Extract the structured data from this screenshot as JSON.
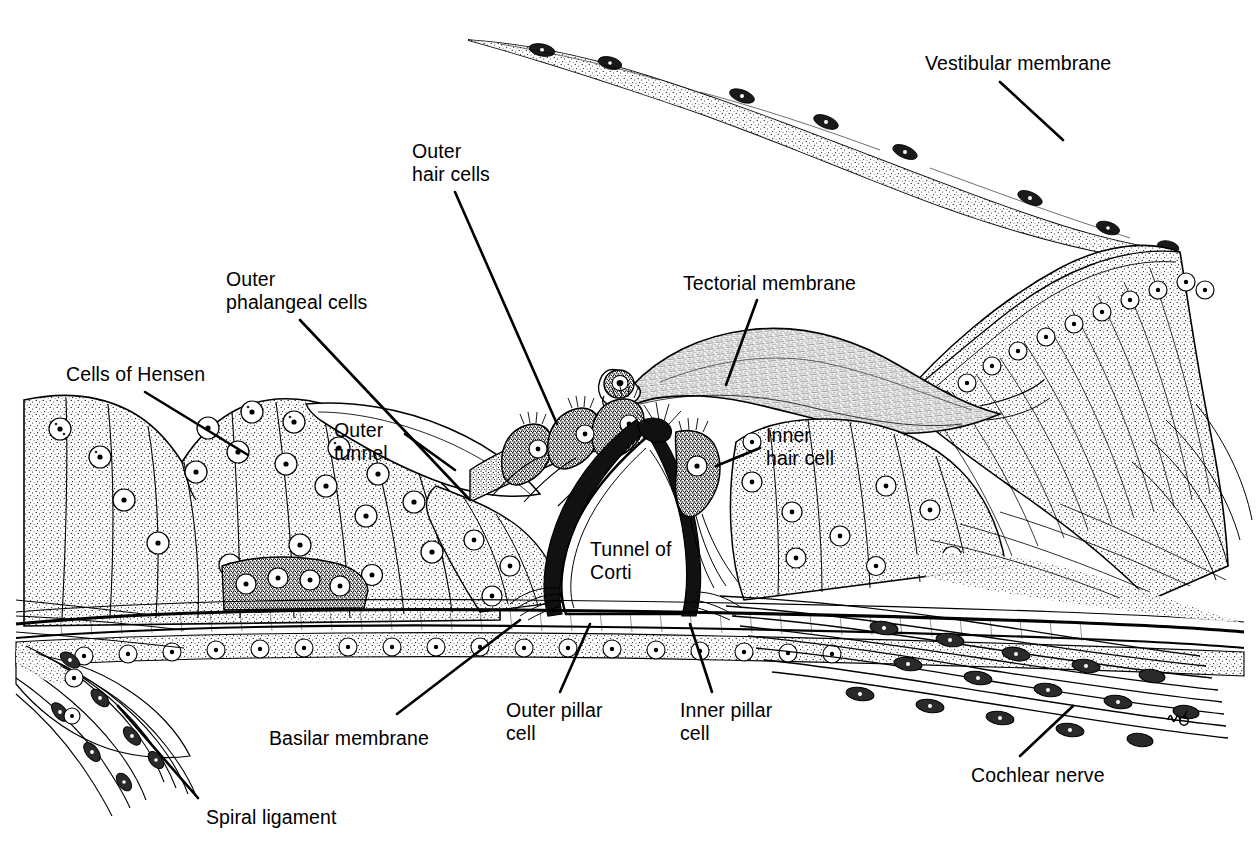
{
  "figure": {
    "style": "black-and-white stippled line drawing",
    "artist_signature": "uo"
  },
  "labels": [
    {
      "id": "vestibular-membrane",
      "text": "Vestibular membrane",
      "x": 925,
      "y": 52,
      "align": "left",
      "leader": [
        [
          1000,
          82
        ],
        [
          1063,
          140
        ]
      ]
    },
    {
      "id": "outer-hair-cells",
      "text": "Outer\nhair cells",
      "x": 412,
      "y": 140,
      "align": "left",
      "leader": [
        [
          455,
          192
        ],
        [
          557,
          424
        ]
      ]
    },
    {
      "id": "outer-phalangeal-cells",
      "text": "Outer\nphalangeal cells",
      "x": 226,
      "y": 268,
      "align": "left",
      "leader": [
        [
          300,
          320
        ],
        [
          470,
          500
        ]
      ]
    },
    {
      "id": "tectorial-membrane",
      "text": "Tectorial membrane",
      "x": 683,
      "y": 272,
      "align": "left",
      "leader": [
        [
          757,
          300
        ],
        [
          726,
          385
        ]
      ]
    },
    {
      "id": "cells-of-hensen",
      "text": "Cells of Hensen",
      "x": 66,
      "y": 363,
      "align": "left",
      "leader": [
        [
          145,
          392
        ],
        [
          248,
          455
        ]
      ]
    },
    {
      "id": "outer-tunnel",
      "text": "Outer\ntunnel",
      "x": 334,
      "y": 419,
      "align": "left",
      "leader": [
        [
          405,
          434
        ],
        [
          455,
          470
        ]
      ]
    },
    {
      "id": "inner-hair-cell",
      "text": "Inner\nhair cell",
      "x": 766,
      "y": 424,
      "align": "left",
      "leader": [
        [
          760,
          448
        ],
        [
          716,
          466
        ]
      ]
    },
    {
      "id": "tunnel-of-corti",
      "text": "Tunnel of\nCorti",
      "x": 590,
      "y": 538,
      "align": "left",
      "leader": null
    },
    {
      "id": "basilar-membrane",
      "text": "Basilar membrane",
      "x": 269,
      "y": 727,
      "align": "left",
      "leader": [
        [
          397,
          714
        ],
        [
          520,
          620
        ]
      ]
    },
    {
      "id": "outer-pillar-cell",
      "text": "Outer pillar\ncell",
      "x": 506,
      "y": 699,
      "align": "left",
      "leader": [
        [
          560,
          692
        ],
        [
          590,
          624
        ]
      ]
    },
    {
      "id": "inner-pillar-cell",
      "text": "Inner pillar\ncell",
      "x": 680,
      "y": 699,
      "align": "left",
      "leader": [
        [
          712,
          692
        ],
        [
          690,
          624
        ]
      ]
    },
    {
      "id": "cochlear-nerve",
      "text": "Cochlear nerve",
      "x": 971,
      "y": 764,
      "align": "left",
      "leader": [
        [
          1020,
          756
        ],
        [
          1073,
          706
        ]
      ]
    },
    {
      "id": "spiral-ligament",
      "text": "Spiral ligament",
      "x": 206,
      "y": 806,
      "align": "left",
      "leader": [
        [
          198,
          798
        ],
        [
          118,
          706
        ]
      ]
    }
  ],
  "structures": [
    {
      "id": "vestibular-membrane",
      "name": "Vestibular membrane (Reissner's membrane)",
      "description": "thin two-cell-thick undulating sheet running from upper-left to upper-right"
    },
    {
      "id": "tectorial-membrane",
      "name": "Tectorial membrane",
      "description": "wavy fibrous flap with spiral curled free end overlying the hair cells"
    },
    {
      "id": "spiral-limbus",
      "name": "Spiral limbus",
      "description": "large stippled wedge at right with radial striations and a row of nuclei"
    },
    {
      "id": "organ-of-corti",
      "name": "Organ of Corti",
      "description": "central cell complex containing hair cells, pillar cells and tunnel"
    },
    {
      "id": "tunnel-of-corti",
      "name": "Tunnel of Corti",
      "description": "clear triangular space between inner and outer pillar cells"
    },
    {
      "id": "outer-hair-cells",
      "name": "Outer hair cells",
      "description": "three darkly stippled tilted cells with apical stereocilia"
    },
    {
      "id": "inner-hair-cell",
      "name": "Inner hair cell",
      "description": "single flask-shaped cell medial to the inner pillar cell"
    },
    {
      "id": "cells-of-hensen",
      "name": "Cells of Hensen",
      "description": "tall columnar supporting cells at the left forming a sloping bank"
    },
    {
      "id": "outer-phalangeal-cells",
      "name": "Outer phalangeal cells (Deiters' cells)",
      "description": "supporting cells beneath and between the outer hair cells"
    },
    {
      "id": "outer-tunnel",
      "name": "Outer tunnel",
      "description": "clear space lateral to the outer hair cells"
    },
    {
      "id": "basilar-membrane",
      "name": "Basilar membrane",
      "description": "horizontal fibrous band running the full width beneath the organ of Corti"
    },
    {
      "id": "cochlear-nerve",
      "name": "Cochlear nerve",
      "description": "bundled nerve fibres sweeping down and right below the limbus"
    },
    {
      "id": "spiral-ligament",
      "name": "Spiral ligament",
      "description": "fibrous tissue at lower-left anchoring the basilar membrane"
    }
  ],
  "colors": {
    "ink": "#000000",
    "paper": "#ffffff",
    "stipple": "#000000",
    "dark_cell": "#3a3a3a"
  }
}
